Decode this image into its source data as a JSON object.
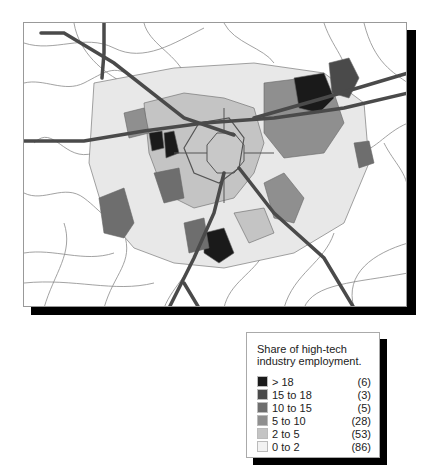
{
  "map": {
    "description": "Choropleth map of metro area tracts with highways",
    "colors": {
      "background": "#ffffff",
      "road_minor": "#888888",
      "road_major": "#555555",
      "boundary": "#666666"
    }
  },
  "legend": {
    "title": "Share of high-tech industry employment.",
    "classes": [
      {
        "label": "> 18",
        "count": "(6)",
        "color": "#1a1a1a"
      },
      {
        "label": "15 to 18",
        "count": "(3)",
        "color": "#4a4a4a"
      },
      {
        "label": "10 to 15",
        "count": "(5)",
        "color": "#6e6e6e"
      },
      {
        "label": "5 to 10",
        "count": "(28)",
        "color": "#8f8f8f"
      },
      {
        "label": "2 to 5",
        "count": "(53)",
        "color": "#c4c4c4"
      },
      {
        "label": "0 to 2",
        "count": "(86)",
        "color": "#f2f2f2"
      }
    ]
  }
}
